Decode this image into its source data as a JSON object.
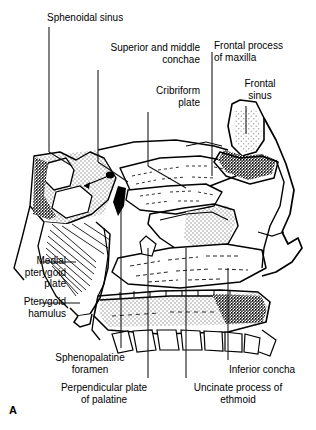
{
  "figure": {
    "letter": "A",
    "view": "sagittal-section"
  },
  "labels": [
    {
      "id": "sphenoidal-sinus",
      "text": "Sphenoidal sinus",
      "align": "left",
      "x": 47,
      "y": 12,
      "w": 120
    },
    {
      "id": "superior-middle-conchae",
      "text": "Superior and middle\nconchae",
      "align": "right",
      "x": 80,
      "y": 42,
      "w": 120
    },
    {
      "id": "cribriform-plate",
      "text": "Cribriform\nplate",
      "align": "right",
      "x": 96,
      "y": 85,
      "w": 104
    },
    {
      "id": "frontal-process-maxilla",
      "text": "Frontal process\nof maxilla",
      "align": "left",
      "x": 214,
      "y": 40,
      "w": 100
    },
    {
      "id": "frontal-sinus",
      "text": "Frontal\nsinus",
      "align": "center",
      "x": 224,
      "y": 78,
      "w": 72
    },
    {
      "id": "medial-pterygoid-plate",
      "text": "Medial\npterygoid\nplate",
      "align": "right",
      "x": 0,
      "y": 255,
      "w": 66
    },
    {
      "id": "pterygoid-hamulus",
      "text": "Pterygoid\nhamulus",
      "align": "right",
      "x": 0,
      "y": 296,
      "w": 66
    },
    {
      "id": "sphenopalatine-foramen",
      "text": "Sphenopalatine\nforamen",
      "align": "center",
      "x": 38,
      "y": 352,
      "w": 104
    },
    {
      "id": "perpendicular-plate-palatine",
      "text": "Perpendicular plate\nof palatine",
      "align": "center",
      "x": 42,
      "y": 382,
      "w": 124
    },
    {
      "id": "uncinate-process-ethmoid",
      "text": "Uncinate process of\nethmoid",
      "align": "center",
      "x": 176,
      "y": 382,
      "w": 124
    },
    {
      "id": "inferior-concha",
      "text": "Inferior concha",
      "align": "center",
      "x": 214,
      "y": 364,
      "w": 96
    }
  ],
  "colors": {
    "ink": "#000000",
    "paper": "#ffffff",
    "bone_fill": "#d9d9d9",
    "sinus_fill": "#dedede",
    "leader": "#1a1a1a"
  },
  "structures": [
    {
      "id": "sphenoid-body",
      "name": "Body of sphenoid",
      "fill": "stipple-gray"
    },
    {
      "id": "sphenoidal-sinus-cavity",
      "name": "Sphenoidal sinus cavity",
      "fill": "white"
    },
    {
      "id": "pterygoid-plate",
      "name": "Medial pterygoid plate",
      "fill": "white-striated"
    },
    {
      "id": "cribriform-plate",
      "name": "Cribriform plate",
      "fill": "white"
    },
    {
      "id": "superior-concha",
      "name": "Superior concha",
      "fill": "white"
    },
    {
      "id": "middle-concha",
      "name": "Middle concha",
      "fill": "stipple-gray"
    },
    {
      "id": "inferior-concha",
      "name": "Inferior concha",
      "fill": "white"
    },
    {
      "id": "frontal-sinus-cavity",
      "name": "Frontal sinus cavity",
      "fill": "stipple-gray"
    },
    {
      "id": "frontal-process",
      "name": "Frontal process of maxilla",
      "fill": "dense-stipple"
    },
    {
      "id": "hard-palate",
      "name": "Hard palate",
      "fill": "stipple-gray"
    },
    {
      "id": "maxillary-teeth",
      "name": "Maxillary teeth",
      "fill": "white"
    },
    {
      "id": "sphenopalatine-foramen-mark",
      "name": "Sphenopalatine foramen",
      "fill": "solid-black"
    }
  ]
}
